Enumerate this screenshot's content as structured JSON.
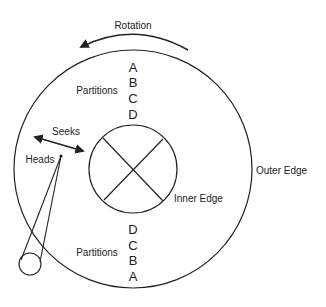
{
  "diagram": {
    "labels": {
      "rotation": "Rotation",
      "partitions_top": "Partitions",
      "partitions_bottom": "Partitions",
      "seeks": "Seeks",
      "heads": "Heads",
      "inner_edge": "Inner Edge",
      "outer_edge": "Outer Edge"
    },
    "partitions_top_letters": [
      "A",
      "B",
      "C",
      "D"
    ],
    "partitions_bottom_letters": [
      "D",
      "C",
      "B",
      "A"
    ],
    "colors": {
      "stroke": "#222222",
      "background": "#ffffff"
    }
  }
}
